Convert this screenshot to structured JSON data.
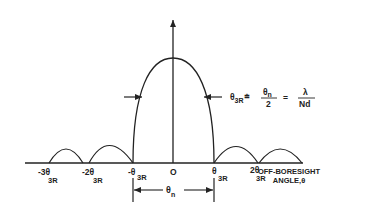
{
  "diagram": {
    "axis_label_line1": "OFF-BORESIGHT",
    "axis_label_line2": "ANGLE,θ",
    "origin_label": "O",
    "ticks": [
      {
        "main": "-3θ",
        "sub": "3R"
      },
      {
        "main": "-2θ",
        "sub": "3R"
      },
      {
        "main": "-θ",
        "sub": "3R"
      },
      {
        "main": "θ",
        "sub": "3R"
      },
      {
        "main": "2θ",
        "sub": "3R"
      }
    ],
    "null_width_label": {
      "main": "θ",
      "sub": "n"
    },
    "equation": {
      "lhs_main": "θ",
      "lhs_sub": "3R",
      "approx": "≐",
      "frac1_num_main": "θ",
      "frac1_num_sub": "n",
      "frac1_den": "2",
      "equals": "=",
      "frac2_num": "λ",
      "frac2_den": "Nd"
    },
    "colors": {
      "line": "#222222",
      "background": "#ffffff"
    }
  }
}
